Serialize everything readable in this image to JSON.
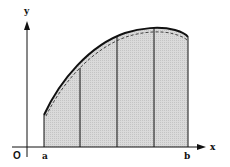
{
  "diagram": {
    "type": "area-under-curve",
    "labels": {
      "y_axis": "y",
      "x_axis": "x",
      "origin": "O",
      "a": "a",
      "b": "b"
    },
    "colors": {
      "fill": "#d4d4d4",
      "stroke": "#111111",
      "background": "#ffffff"
    },
    "strips": 4,
    "strip_lines_x_px": [
      44,
      80,
      117,
      154,
      188
    ]
  }
}
